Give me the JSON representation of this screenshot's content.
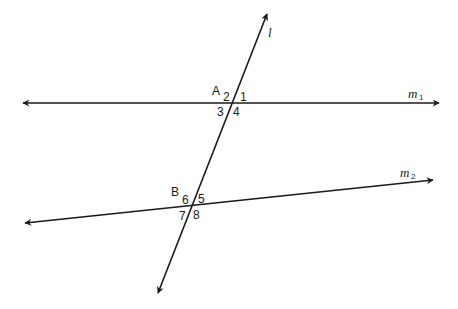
{
  "diagram": {
    "type": "parallel-lines-transversal",
    "colors": {
      "ink": "#1a1a1a",
      "background": "#ffffff"
    },
    "lines": {
      "m1": {
        "label": "m",
        "subscript": "1",
        "from": [
          23,
          103
        ],
        "to": [
          439,
          103
        ]
      },
      "m2": {
        "label": "m",
        "subscript": "2",
        "from": [
          25,
          223
        ],
        "to": [
          433,
          180
        ]
      },
      "l": {
        "label": "l",
        "from": [
          158,
          293
        ],
        "to": [
          267,
          14
        ]
      }
    },
    "points": {
      "A": {
        "label": "A",
        "at": [
          233,
          103
        ]
      },
      "B": {
        "label": "B",
        "at": [
          192,
          207
        ]
      }
    },
    "angles": {
      "a1": "1",
      "a2": "2",
      "a3": "3",
      "a4": "4",
      "a5": "5",
      "a6": "6",
      "a7": "7",
      "a8": "8"
    }
  }
}
